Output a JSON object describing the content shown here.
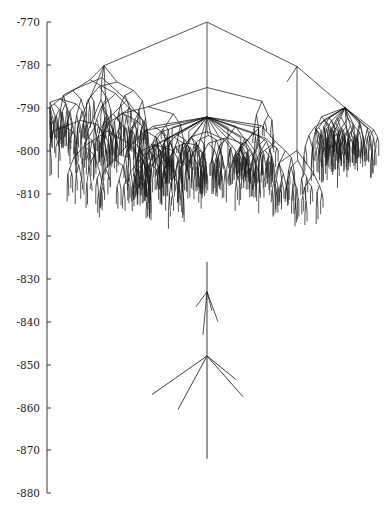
{
  "figure": {
    "title": "",
    "width": 387,
    "height": 514,
    "background_color": "#ffffff",
    "line_color": "#1a1a1a",
    "axis_color": "#4a4a4a"
  },
  "axis": {
    "orientation": "vertical-left",
    "spine_x": 47,
    "top_y": 22,
    "bottom_y": 493,
    "tick_labels": [
      "-770",
      "-780",
      "-790",
      "-800",
      "-810",
      "-820",
      "-830",
      "-840",
      "-850",
      "-860",
      "-870",
      "-880"
    ],
    "tick_values": [
      -770,
      -780,
      -790,
      -800,
      -810,
      -820,
      -830,
      -840,
      -850,
      -860,
      -870,
      -880
    ],
    "tick_y_positions": [
      22,
      65,
      108,
      151,
      194,
      236,
      279,
      322,
      365,
      408,
      450,
      493
    ],
    "ylim": [
      -880,
      -770
    ],
    "ylabel": "",
    "xlabel": "",
    "grid": false
  },
  "chart_data": {
    "type": "tree",
    "title": "",
    "xlabel": "",
    "ylabel": "",
    "ylim": [
      -880,
      -770
    ],
    "grid": false,
    "legend": null,
    "root": {
      "x": 207,
      "y": -770.0
    },
    "node_count": 520,
    "tip_count": 286,
    "seed": 20240117,
    "clusters": [
      {
        "name": "left-clade",
        "x": 104,
        "y": -780.2,
        "span": [
          60,
          150
        ],
        "density": 0.95,
        "depth_max": -829
      },
      {
        "name": "center-clade",
        "x": 207,
        "y": -785.3,
        "span": [
          130,
          290
        ],
        "density": 1.0,
        "depth_max": -848
      },
      {
        "name": "right-clade",
        "x": 297,
        "y": -780.4,
        "span": [
          275,
          382
        ],
        "density": 0.9,
        "depth_max": -833
      },
      {
        "name": "deep-lineage",
        "x": 207,
        "y": -848.0,
        "span": [
          152,
          242
        ],
        "density": 0.2,
        "depth_max": -872
      }
    ]
  }
}
